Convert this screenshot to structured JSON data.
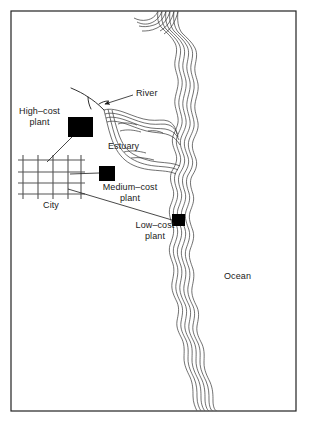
{
  "figure": {
    "frame": {
      "x": 11,
      "y": 11,
      "width": 285,
      "height": 400,
      "stroke": "#222222",
      "stroke_width": 1.2
    },
    "background_color": "#ffffff",
    "ink_color": "#1a1a1a"
  },
  "labels": {
    "river": "River",
    "estuary": "Estuary",
    "ocean": "Ocean",
    "city": "City",
    "high_cost_plant": "High–cost\nplant",
    "medium_cost_plant": "Medium–cost\nplant",
    "low_cost_plant": "Low–cost\nplant"
  },
  "label_positions": {
    "river": {
      "x": 112,
      "y": 92,
      "width": 40,
      "align": "left"
    },
    "estuary": {
      "x": 108,
      "y": 144,
      "width": 44,
      "align": "left"
    },
    "ocean": {
      "x": 224,
      "y": 270,
      "width": 38,
      "align": "left"
    },
    "city": {
      "x": 36,
      "y": 199,
      "width": 30,
      "align": "center"
    },
    "high_cost_plant": {
      "x": 16,
      "y": 108,
      "width": 50,
      "align": "center"
    },
    "medium_cost_plant": {
      "x": 99,
      "y": 181,
      "width": 62,
      "align": "center"
    },
    "low_cost_plant": {
      "x": 130,
      "y": 221,
      "width": 50,
      "align": "center"
    }
  },
  "plants": [
    {
      "name": "high-cost-plant",
      "x": 68,
      "y": 117,
      "width": 25,
      "height": 20,
      "fill": "#000000"
    },
    {
      "name": "medium-cost-plant",
      "x": 99,
      "y": 166,
      "width": 16,
      "height": 15,
      "fill": "#000000"
    },
    {
      "name": "low-cost-plant",
      "x": 172,
      "y": 214,
      "width": 13,
      "height": 12,
      "fill": "#000000"
    }
  ],
  "city_grid": {
    "x": 19,
    "y": 157,
    "width": 64,
    "height": 41,
    "vertical_lines": 5,
    "horizontal_lines": 4,
    "stroke": "#555555",
    "stroke_width": 1.1
  },
  "leader_lines": [
    {
      "name": "river-leader",
      "x1": 132,
      "y1": 96,
      "x2": 103,
      "y2": 104,
      "arrow": true
    },
    {
      "name": "high-cost-leader",
      "x1": 73,
      "y1": 136,
      "x2": 48,
      "y2": 162,
      "arrow": false
    },
    {
      "name": "medium-cost-leader",
      "x1": 99,
      "y1": 173,
      "x2": 72,
      "y2": 174,
      "arrow": false
    },
    {
      "name": "low-cost-leader",
      "x1": 172,
      "y1": 220,
      "x2": 69,
      "y2": 188,
      "arrow": false
    }
  ],
  "river": {
    "name": "river-channel",
    "path": "M 71,88 L 88,96 L 96,100 L 100,104 L 104,109 M 88,96 L 90,107 M 100,104 L 107,101"
  },
  "coastline": {
    "name": "shoreline-contours",
    "line_count": 6,
    "stroke": "#333333",
    "stroke_width": 0.7,
    "description": "Six nested wavy contour lines tracing the ocean shoreline from the top edge down to the bottom edge, bulging west into the estuary inlet."
  },
  "estuary_shape": {
    "name": "estuary-contours",
    "line_count": 7,
    "description": "Nested contour outlines of a funnel-shaped estuary opening eastward into the ocean."
  }
}
